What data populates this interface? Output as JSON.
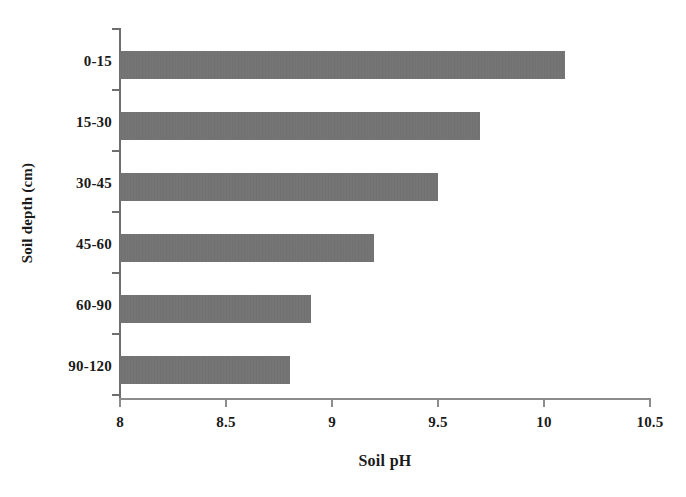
{
  "chart_data": {
    "type": "bar",
    "orientation": "horizontal",
    "title": "",
    "xlabel": "Soil pH",
    "ylabel": "Soil depth (cm)",
    "categories": [
      "0-15",
      "15-30",
      "30-45",
      "45-60",
      "60-90",
      "90-120"
    ],
    "values": [
      10.1,
      9.7,
      9.5,
      9.2,
      8.9,
      8.8
    ],
    "series": [
      {
        "name": "Soil pH",
        "values": [
          10.1,
          9.7,
          9.5,
          9.2,
          8.9,
          8.8
        ]
      }
    ],
    "xlim": [
      8,
      10.5
    ],
    "xticks": [
      8,
      8.5,
      9,
      9.5,
      10,
      10.5
    ],
    "xtick_labels": [
      "8",
      "8.5",
      "9",
      "9.5",
      "10",
      "10.5"
    ],
    "grid": false,
    "legend": false,
    "bar_color": "#737373",
    "axis_color": "#6e6e6e",
    "background": "#ffffff"
  }
}
